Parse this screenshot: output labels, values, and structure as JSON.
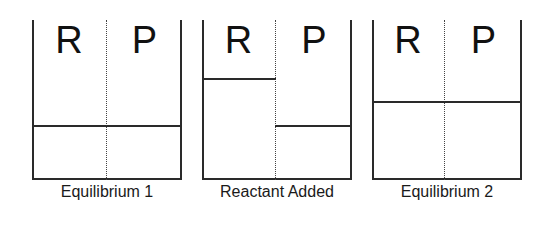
{
  "diagram": {
    "title": "",
    "panels": [
      {
        "caption": "Equilibrium 1",
        "left_label": "R",
        "right_label": "P",
        "reactant_level_pct": 34,
        "product_level_pct": 34
      },
      {
        "caption": "Reactant Added",
        "left_label": "R",
        "right_label": "P",
        "reactant_level_pct": 63,
        "product_level_pct": 34
      },
      {
        "caption": "Equilibrium 2",
        "left_label": "R",
        "right_label": "P",
        "reactant_level_pct": 49,
        "product_level_pct": 49
      }
    ],
    "colors": {
      "line": "#2a2a2a",
      "background": "#ffffff"
    }
  }
}
